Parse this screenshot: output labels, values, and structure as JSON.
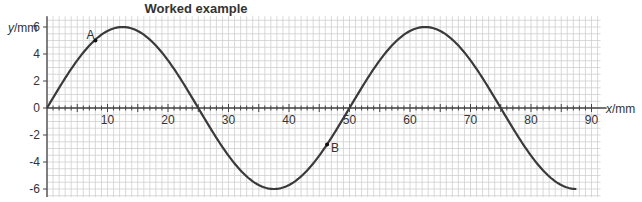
{
  "title": "Worked example",
  "chart_data": {
    "type": "line",
    "title": "Worked example",
    "xlabel": "x/mm",
    "ylabel": "y/mm",
    "xlim": [
      0,
      90
    ],
    "ylim": [
      -6,
      6
    ],
    "x_ticks": [
      10,
      20,
      30,
      40,
      50,
      60,
      70,
      80,
      90
    ],
    "y_ticks": [
      6,
      4,
      2,
      0,
      -2,
      -4,
      -6
    ],
    "grid": true,
    "minor_grid": {
      "x_step": 1,
      "y_step": 0.5
    },
    "series": [
      {
        "name": "wave",
        "function": "y = 6 sin(2*pi*x/50)",
        "amplitude": 6,
        "wavelength": 50,
        "x_start": 0,
        "x_end": 87.5,
        "x": [
          0,
          6.25,
          12.5,
          18.75,
          25,
          31.25,
          37.5,
          43.75,
          50,
          56.25,
          62.5,
          68.75,
          75,
          81.25,
          87.5
        ],
        "values": [
          0,
          4.24,
          6,
          4.24,
          0,
          -4.24,
          -6,
          -4.24,
          0,
          4.24,
          6,
          4.24,
          0,
          -4.24,
          -6
        ]
      }
    ],
    "annotations": [
      {
        "label": "A",
        "x": 8,
        "y": 5.0
      },
      {
        "label": "B",
        "x": 46.3,
        "y": -2.7
      }
    ]
  }
}
